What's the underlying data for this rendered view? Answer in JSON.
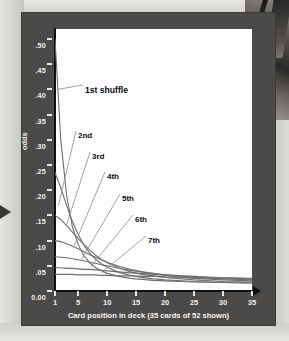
{
  "chart_data": {
    "type": "line",
    "title": "",
    "xlabel": "Card position in deck (35 cards of 52 shown)",
    "ylabel": "odds",
    "xlim": [
      1,
      35
    ],
    "ylim": [
      0.0,
      0.52
    ],
    "grid": false,
    "legend_position": "inline-annotations",
    "ytick_labels": [
      ".50",
      ".45",
      ".40",
      ".35",
      ".30",
      ".25",
      ".20",
      ".15",
      ".10",
      ".05",
      "0.00"
    ],
    "ytick_values": [
      0.5,
      0.45,
      0.4,
      0.35,
      0.3,
      0.25,
      0.2,
      0.15,
      0.1,
      0.05,
      0.0
    ],
    "xtick_labels": [
      "1",
      "5",
      "10",
      "15",
      "20",
      "25",
      "30",
      "35"
    ],
    "xtick_values": [
      1,
      5,
      10,
      15,
      20,
      25,
      30,
      35
    ],
    "x": [
      1,
      2,
      3,
      4,
      5,
      6,
      7,
      8,
      9,
      10,
      12,
      14,
      16,
      18,
      20,
      25,
      30,
      35
    ],
    "series": [
      {
        "name": "1st shuffle",
        "label": "1st shuffle",
        "values": [
          0.5,
          0.3,
          0.19,
          0.128,
          0.092,
          0.07,
          0.056,
          0.046,
          0.04,
          0.035,
          0.029,
          0.025,
          0.023,
          0.021,
          0.02,
          0.018,
          0.017,
          0.016
        ]
      },
      {
        "name": "2nd",
        "label": "2nd",
        "values": [
          0.235,
          0.205,
          0.17,
          0.138,
          0.112,
          0.091,
          0.075,
          0.063,
          0.054,
          0.047,
          0.037,
          0.031,
          0.027,
          0.024,
          0.022,
          0.019,
          0.017,
          0.016
        ]
      },
      {
        "name": "3rd",
        "label": "3rd",
        "values": [
          0.15,
          0.142,
          0.13,
          0.117,
          0.104,
          0.092,
          0.081,
          0.071,
          0.063,
          0.056,
          0.046,
          0.038,
          0.033,
          0.03,
          0.027,
          0.022,
          0.019,
          0.018
        ]
      },
      {
        "name": "4th",
        "label": "4th",
        "values": [
          0.1,
          0.098,
          0.094,
          0.089,
          0.084,
          0.078,
          0.072,
          0.067,
          0.062,
          0.057,
          0.049,
          0.043,
          0.038,
          0.034,
          0.031,
          0.025,
          0.022,
          0.02
        ]
      },
      {
        "name": "5th",
        "label": "5th",
        "values": [
          0.068,
          0.067,
          0.066,
          0.064,
          0.062,
          0.06,
          0.057,
          0.055,
          0.052,
          0.05,
          0.045,
          0.041,
          0.038,
          0.035,
          0.032,
          0.027,
          0.024,
          0.022
        ]
      },
      {
        "name": "6th",
        "label": "6th",
        "values": [
          0.046,
          0.046,
          0.045,
          0.045,
          0.044,
          0.043,
          0.043,
          0.042,
          0.041,
          0.04,
          0.038,
          0.036,
          0.035,
          0.033,
          0.032,
          0.029,
          0.026,
          0.024
        ]
      },
      {
        "name": "7th",
        "label": "7th",
        "values": [
          0.033,
          0.033,
          0.033,
          0.033,
          0.032,
          0.032,
          0.032,
          0.032,
          0.031,
          0.031,
          0.03,
          0.03,
          0.029,
          0.029,
          0.028,
          0.027,
          0.026,
          0.025
        ]
      }
    ],
    "colors": {
      "panel_background": "#4c4a48",
      "plot_background": "#fdfdfd",
      "axis": "#111111",
      "tick_label": "#f2f1ee",
      "curve": "#6f6f6f",
      "annotation": "#0b0b0b",
      "page_background": "#d6d5d0"
    }
  }
}
